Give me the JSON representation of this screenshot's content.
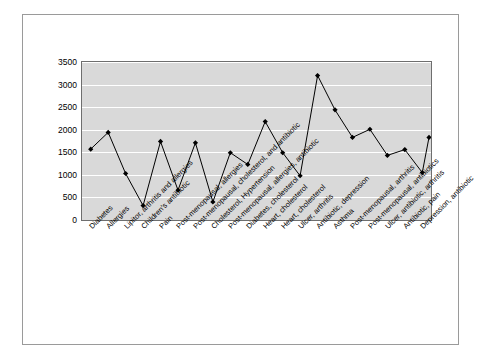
{
  "chart_data": {
    "type": "line",
    "title": "",
    "xlabel": "",
    "ylabel": "",
    "ylim": [
      0,
      3500
    ],
    "yticks": [
      0,
      500,
      1000,
      1500,
      2000,
      2500,
      3000,
      3500
    ],
    "ytick_labels": [
      "0",
      "500",
      "1000",
      "1500",
      "2000",
      "2500",
      "3000",
      "3500"
    ],
    "grid": true,
    "legend": "none",
    "marker": "diamond",
    "line_color": "#000000",
    "plot_background": "#d9d9d9",
    "gridline_color": "#ffffff",
    "categories": [
      "Diabetes",
      "Allergies",
      "Lipitor, arthritis and allergies",
      "Children's antibiotic",
      "Pain",
      "Post-menopausal, allergies",
      "Post-menopausal, cholesterol, and antibiotic",
      "Cholesterol, Hypertension",
      "Post-menopausal, allergies, antibiotic",
      "Diabetes, cholesterol",
      "Heart, cholesterol",
      "Heart, cholesterol",
      "Ulcer, arthritis",
      "Antibiotic, depression",
      "Asthma",
      "Post-menopausal, arthritis",
      "Post-menopausal, antibiotics",
      "Ulcer, antibiotic, arthritis",
      "Antibiotic, pain",
      "Depression, antibiotic"
    ],
    "values": [
      1570,
      1940,
      1030,
      320,
      1740,
      660,
      1710,
      400,
      1490,
      1230,
      2180,
      1490,
      980,
      3200,
      2440,
      1830,
      2010,
      1430,
      1560,
      1050
    ],
    "extra_points": [
      1830
    ]
  }
}
